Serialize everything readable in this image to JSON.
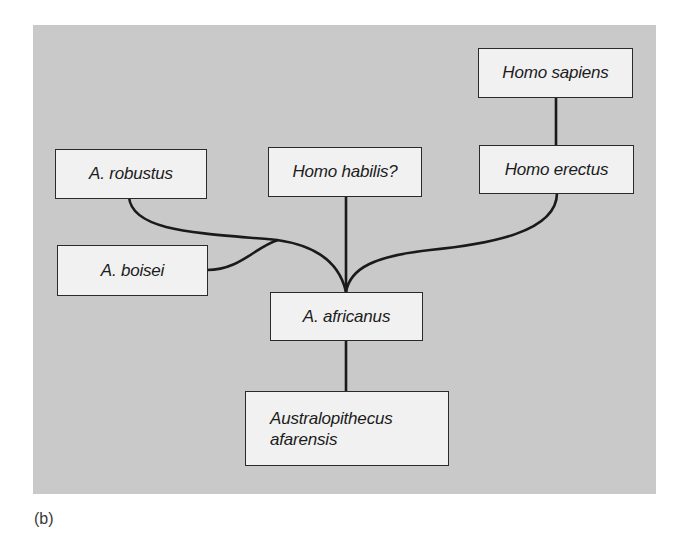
{
  "diagram": {
    "type": "phylogenetic-tree",
    "caption": "(b)",
    "colors": {
      "panel_background": "#c9c9c9",
      "node_fill": "#f1f1f1",
      "node_border": "#2a2a2a",
      "link_color": "#1a1a1a"
    },
    "nodes": {
      "homo_sapiens": {
        "label": "Homo sapiens"
      },
      "homo_erectus": {
        "label": "Homo erectus"
      },
      "homo_habilis": {
        "label": "Homo habilis?"
      },
      "a_robustus": {
        "label": "A. robustus"
      },
      "a_boisei": {
        "label": "A. boisei"
      },
      "a_africanus": {
        "label": "A. africanus"
      },
      "a_afarensis": {
        "label": "Australopithecus\nafarensis"
      }
    },
    "edges": [
      {
        "from": "a_afarensis",
        "to": "a_africanus"
      },
      {
        "from": "a_africanus",
        "to": "homo_habilis"
      },
      {
        "from": "a_africanus",
        "to": "a_robustus"
      },
      {
        "from": "a_robustus",
        "to": "a_boisei",
        "note": "branches from robustus lineage"
      },
      {
        "from": "a_africanus",
        "to": "homo_erectus"
      },
      {
        "from": "homo_erectus",
        "to": "homo_sapiens"
      }
    ]
  }
}
